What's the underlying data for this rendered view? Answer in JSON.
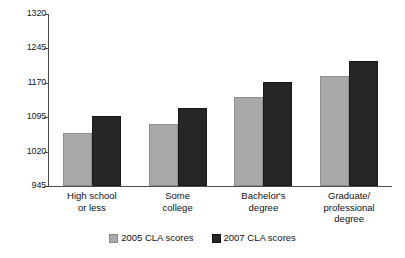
{
  "chart_data": {
    "type": "bar",
    "title": "",
    "xlabel": "",
    "ylabel": "",
    "ylim": [
      945,
      1320
    ],
    "yticks": [
      945,
      1020,
      1095,
      1170,
      1245,
      1320
    ],
    "grid": false,
    "legend_position": "bottom-center",
    "categories": [
      "High school\nor less",
      "Some\ncollege",
      "Bachelor's\ndegree",
      "Graduate/\nprofessional\ndegree"
    ],
    "category_lines": [
      [
        "High school",
        "or less"
      ],
      [
        "Some",
        "college"
      ],
      [
        "Bachelor's",
        "degree"
      ],
      [
        "Graduate/",
        "professional",
        "degree"
      ]
    ],
    "series": [
      {
        "name": "2005 CLA scores",
        "color": "#a9a9a9",
        "values": [
          1060,
          1080,
          1138,
          1185
        ]
      },
      {
        "name": "2007 CLA scores",
        "color": "#262626",
        "values": [
          1098,
          1115,
          1172,
          1218
        ]
      }
    ]
  },
  "axis": {
    "tick_labels": [
      "1320",
      "1245",
      "1170",
      "1095",
      "1020",
      "945"
    ]
  },
  "legend": {
    "items": [
      {
        "label": "2005 CLA scores"
      },
      {
        "label": "2007 CLA scores"
      }
    ]
  }
}
